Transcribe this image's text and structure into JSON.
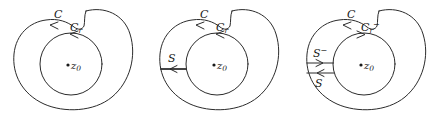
{
  "figure": {
    "background_color": "#ffffff",
    "stroke_color": "#2b2b2b",
    "text_color": "#1a1a1a",
    "panel_count": 3
  },
  "panels": [
    {
      "id": "panel-1",
      "name": "outer-contour-and-inner-circle",
      "labels": {
        "outer_contour": "C",
        "inner_circle_base": "C",
        "inner_circle_sub": "r",
        "inner_circle_sup": "",
        "center_point_base": "z",
        "center_point_sub": "0"
      },
      "cuts": [],
      "outer_direction": "counterclockwise",
      "inner_direction": "counterclockwise"
    },
    {
      "id": "panel-2",
      "name": "with-single-cut-segment",
      "labels": {
        "outer_contour": "C",
        "inner_circle_base": "C",
        "inner_circle_sub": "r",
        "inner_circle_sup": "",
        "center_point_base": "z",
        "center_point_sub": "0"
      },
      "cuts": [
        {
          "label_base": "S",
          "label_sup": "",
          "arrow_direction": "left"
        }
      ],
      "outer_direction": "counterclockwise",
      "inner_direction": "counterclockwise"
    },
    {
      "id": "panel-3",
      "name": "with-opposed-cut-segments",
      "labels": {
        "outer_contour": "C",
        "inner_circle_base": "C",
        "inner_circle_sub": "r",
        "inner_circle_sup": "−",
        "center_point_base": "z",
        "center_point_sub": "0"
      },
      "cuts": [
        {
          "label_base": "S",
          "label_sup": "−",
          "arrow_direction": "right"
        },
        {
          "label_base": "S",
          "label_sup": "",
          "arrow_direction": "left"
        }
      ],
      "outer_direction": "counterclockwise",
      "inner_direction": "clockwise"
    }
  ]
}
